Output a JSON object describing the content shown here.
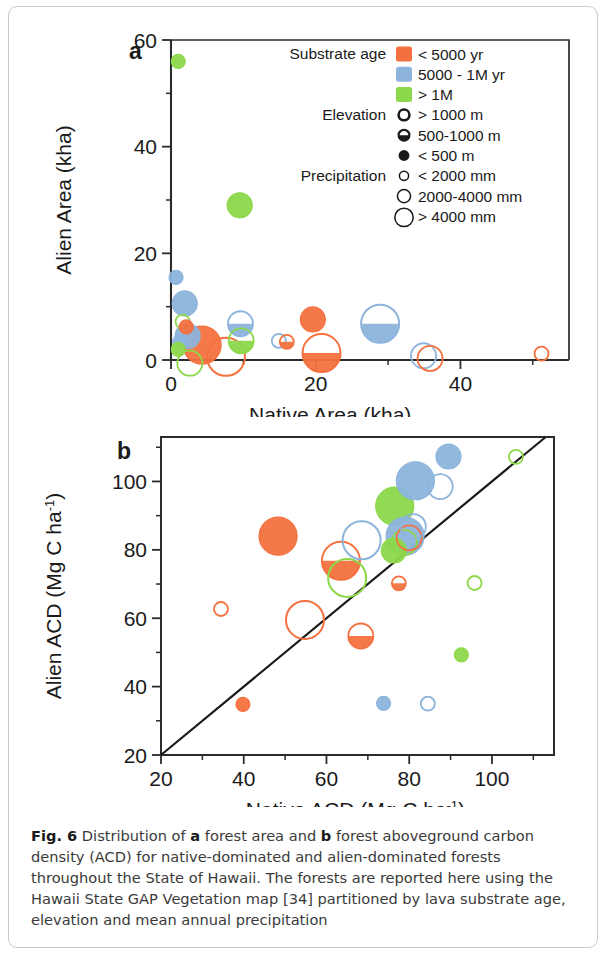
{
  "figure": {
    "number": "Fig. 6",
    "caption_parts": [
      "Distribution of ",
      "a",
      " forest area and ",
      "b",
      " forest aboveground carbon density (ACD) for native-dominated and alien-dominated forests throughout the State of Hawaii. The forests are reported here using the Hawaii State GAP Vegetation map [34] partitioned by lava substrate age, elevation and mean annual precipitation"
    ],
    "caption_text": "Fig. 6 Distribution of a forest area and b forest aboveground carbon density (ACD) for native-dominated and alien-dominated forests throughout the State of Hawaii. The forests are reported here using the Hawaii State GAP Vegetation map [34] partitioned by lava substrate age, elevation and mean annual precipitation"
  },
  "colors": {
    "orange": "#F4713F",
    "blue": "#8CB4DC",
    "green": "#8CD84A",
    "axis": "#2b2b2b",
    "border": "#c9c9c9",
    "line": "#1a1a1a"
  },
  "legend": {
    "groups": [
      {
        "title": "Substrate age",
        "items": [
          {
            "label": "< 5000 yr",
            "swatch": "orange-square"
          },
          {
            "label": "5000 - 1M yr",
            "swatch": "blue-square"
          },
          {
            "label": "> 1M",
            "swatch": "green-square"
          }
        ]
      },
      {
        "title": "Elevation",
        "items": [
          {
            "label": "> 1000 m",
            "swatch": "open-circle"
          },
          {
            "label": "500-1000 m",
            "swatch": "half-filled-circle"
          },
          {
            "label": "< 500 m",
            "swatch": "filled-circle"
          }
        ]
      },
      {
        "title": "Precipitation",
        "items": [
          {
            "label": "< 2000 mm",
            "swatch": "small-circle"
          },
          {
            "label": "2000-4000 mm",
            "swatch": "medium-circle"
          },
          {
            "label": "> 4000 mm",
            "swatch": "large-circle"
          }
        ]
      }
    ]
  },
  "chart_data": [
    {
      "panel": "a",
      "type": "scatter",
      "title": "a",
      "xlabel": "Native Area (kha)",
      "ylabel": "Alien Area (kha)",
      "xlim": [
        0,
        55
      ],
      "ylim": [
        0,
        60
      ],
      "xticks": [
        0,
        20,
        40
      ],
      "xticks_minor": [
        10,
        30,
        50
      ],
      "yticks": [
        0,
        20,
        40,
        60
      ],
      "yticks_minor": [
        10,
        30,
        50
      ],
      "grid": false,
      "legend_position": "top-right-inside",
      "size_encoding": "precipitation (small=<2000mm, medium=2000-4000mm, large=>4000mm)",
      "fill_encoding": "elevation (open=>1000m, half=500-1000m, filled=<500m)",
      "color_encoding": "substrate age (orange=<5000yr, blue=5000-1M yr, green=>1M)",
      "points": [
        {
          "x": 1.0,
          "y": 56.0,
          "color": "green",
          "fill": "full",
          "size": "small"
        },
        {
          "x": 9.5,
          "y": 29.0,
          "color": "green",
          "fill": "full",
          "size": "medium"
        },
        {
          "x": 0.7,
          "y": 15.5,
          "color": "blue",
          "fill": "full",
          "size": "small"
        },
        {
          "x": 1.9,
          "y": 10.6,
          "color": "blue",
          "fill": "full",
          "size": "medium"
        },
        {
          "x": 1.6,
          "y": 7.2,
          "color": "green",
          "fill": "open",
          "size": "small"
        },
        {
          "x": 2.1,
          "y": 6.2,
          "color": "orange",
          "fill": "full",
          "size": "small"
        },
        {
          "x": 2.3,
          "y": 4.5,
          "color": "blue",
          "fill": "full",
          "size": "medium"
        },
        {
          "x": 1.2,
          "y": 3.4,
          "color": "blue",
          "fill": "full",
          "size": "small"
        },
        {
          "x": 1.0,
          "y": 2.0,
          "color": "green",
          "fill": "full",
          "size": "small"
        },
        {
          "x": 4.3,
          "y": 2.8,
          "color": "orange",
          "fill": "full",
          "size": "large"
        },
        {
          "x": 7.6,
          "y": 0.6,
          "color": "orange",
          "fill": "open",
          "size": "large"
        },
        {
          "x": 2.6,
          "y": -0.6,
          "color": "green",
          "fill": "open",
          "size": "medium"
        },
        {
          "x": 9.6,
          "y": 6.8,
          "color": "blue",
          "fill": "half",
          "size": "medium"
        },
        {
          "x": 9.7,
          "y": 3.6,
          "color": "green",
          "fill": "half",
          "size": "medium"
        },
        {
          "x": 14.9,
          "y": 3.6,
          "color": "blue",
          "fill": "open",
          "size": "small"
        },
        {
          "x": 16.0,
          "y": 3.4,
          "color": "orange",
          "fill": "half",
          "size": "small"
        },
        {
          "x": 19.6,
          "y": 7.6,
          "color": "orange",
          "fill": "full",
          "size": "medium"
        },
        {
          "x": 20.8,
          "y": 1.3,
          "color": "orange",
          "fill": "half",
          "size": "large"
        },
        {
          "x": 28.9,
          "y": 6.8,
          "color": "blue",
          "fill": "half",
          "size": "large"
        },
        {
          "x": 34.9,
          "y": 0.8,
          "color": "blue",
          "fill": "open",
          "size": "medium"
        },
        {
          "x": 35.8,
          "y": 0.3,
          "color": "orange",
          "fill": "open",
          "size": "medium"
        },
        {
          "x": 51.2,
          "y": 1.2,
          "color": "orange",
          "fill": "open",
          "size": "small"
        }
      ]
    },
    {
      "panel": "b",
      "type": "scatter",
      "title": "b",
      "xlabel": "Native ACD (Mg C ha-1)",
      "xlabel_base": "Native ACD (Mg C ha",
      "xlabel_sup": "-1",
      "xlabel_tail": ")",
      "ylabel_base": "Alien ACD (Mg C ha",
      "ylabel_sup": "-1",
      "ylabel_tail": ")",
      "xlim": [
        20,
        115
      ],
      "ylim": [
        20,
        113
      ],
      "xticks": [
        20,
        40,
        60,
        80,
        100
      ],
      "xticks_minor": [
        30,
        50,
        70,
        90,
        110
      ],
      "yticks": [
        20,
        40,
        60,
        80,
        100
      ],
      "yticks_minor": [
        30,
        50,
        70,
        90,
        110
      ],
      "grid": false,
      "reference_line": {
        "type": "1:1",
        "from": [
          20,
          20
        ],
        "to": [
          113,
          113
        ]
      },
      "points": [
        {
          "x": 34.5,
          "y": 62.7,
          "color": "orange",
          "fill": "open",
          "size": "small"
        },
        {
          "x": 39.8,
          "y": 34.8,
          "color": "orange",
          "fill": "full",
          "size": "small"
        },
        {
          "x": 48.3,
          "y": 84.0,
          "color": "orange",
          "fill": "full",
          "size": "large"
        },
        {
          "x": 54.8,
          "y": 59.5,
          "color": "orange",
          "fill": "open",
          "size": "large"
        },
        {
          "x": 63.5,
          "y": 76.8,
          "color": "orange",
          "fill": "half",
          "size": "large"
        },
        {
          "x": 65.0,
          "y": 71.8,
          "color": "green",
          "fill": "open",
          "size": "large"
        },
        {
          "x": 68.5,
          "y": 82.8,
          "color": "blue",
          "fill": "open",
          "size": "large"
        },
        {
          "x": 68.3,
          "y": 54.8,
          "color": "orange",
          "fill": "half",
          "size": "medium"
        },
        {
          "x": 73.8,
          "y": 35.1,
          "color": "blue",
          "fill": "full",
          "size": "small"
        },
        {
          "x": 76.5,
          "y": 92.8,
          "color": "green",
          "fill": "full",
          "size": "large"
        },
        {
          "x": 76.3,
          "y": 79.8,
          "color": "green",
          "fill": "full",
          "size": "medium"
        },
        {
          "x": 77.5,
          "y": 70.2,
          "color": "orange",
          "fill": "half",
          "size": "small"
        },
        {
          "x": 79.0,
          "y": 84.0,
          "color": "blue",
          "fill": "full",
          "size": "large"
        },
        {
          "x": 78.8,
          "y": 82.2,
          "color": "green",
          "fill": "open",
          "size": "medium"
        },
        {
          "x": 80.0,
          "y": 83.5,
          "color": "orange",
          "fill": "open",
          "size": "medium"
        },
        {
          "x": 81.0,
          "y": 86.8,
          "color": "blue",
          "fill": "open",
          "size": "medium"
        },
        {
          "x": 81.5,
          "y": 100.2,
          "color": "blue",
          "fill": "full",
          "size": "large"
        },
        {
          "x": 84.5,
          "y": 35.0,
          "color": "blue",
          "fill": "open",
          "size": "small"
        },
        {
          "x": 87.5,
          "y": 98.5,
          "color": "blue",
          "fill": "open",
          "size": "medium"
        },
        {
          "x": 89.5,
          "y": 107.3,
          "color": "blue",
          "fill": "full",
          "size": "medium"
        },
        {
          "x": 92.6,
          "y": 49.3,
          "color": "green",
          "fill": "full",
          "size": "small"
        },
        {
          "x": 95.8,
          "y": 70.3,
          "color": "green",
          "fill": "open",
          "size": "small"
        },
        {
          "x": 105.8,
          "y": 107.2,
          "color": "green",
          "fill": "open",
          "size": "small"
        }
      ]
    }
  ]
}
